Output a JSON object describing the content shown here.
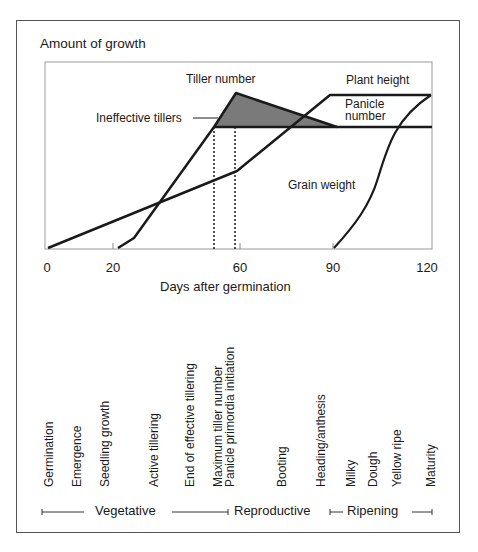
{
  "figure": {
    "y_axis_title": "Amount of growth",
    "x_axis_title": "Days after germination",
    "x_ticks": [
      "0",
      "20",
      "60",
      "90",
      "120"
    ],
    "curve_labels": {
      "tiller_number": "Tiller number",
      "ineffective_tillers": "Ineffective tillers",
      "plant_height": "Plant height",
      "panicle_number_line1": "Panicle",
      "panicle_number_line2": "number",
      "grain_weight": "Grain weight"
    },
    "stages": [
      {
        "label": "Germination"
      },
      {
        "label": "Emergence"
      },
      {
        "label": "Seedling growth"
      },
      {
        "label": "Active tillering"
      },
      {
        "label": "End of effective tillering"
      },
      {
        "label": "Maximum tiller number"
      },
      {
        "label": "Panicle primordia initiation"
      },
      {
        "label": "Booting"
      },
      {
        "label": "Heading/anthesis"
      },
      {
        "label": "Milky"
      },
      {
        "label": "Dough"
      },
      {
        "label": "Yellow ripe"
      },
      {
        "label": "Maturity"
      }
    ],
    "phases": [
      {
        "label": "Vegetative"
      },
      {
        "label": "Reproductive"
      },
      {
        "label": "Ripening"
      }
    ],
    "colors": {
      "line": "#1a1a1a",
      "shaded_area": "#7a7a7a",
      "axis": "#888888"
    }
  }
}
